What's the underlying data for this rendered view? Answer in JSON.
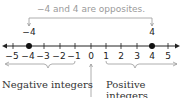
{
  "diagram": {
    "title": "−4 and 4 are opposites.",
    "number_line": {
      "min": -5,
      "max": 5,
      "ticks": [
        -5,
        -4,
        -3,
        -2,
        -1,
        0,
        1,
        2,
        3,
        4,
        5
      ],
      "tick_labels": [
        "−5",
        "−4",
        "−3",
        "−2",
        "−1",
        "0",
        "1",
        "2",
        "3",
        "4",
        "5"
      ],
      "points": [
        {
          "value": -4,
          "label": "−4"
        },
        {
          "value": 4,
          "label": "4"
        }
      ]
    },
    "labels": {
      "negative": "Negative integers",
      "positive": "Positive integers"
    },
    "colors": {
      "axis": "#222222",
      "bracket": "#999999",
      "title": "#9a9a9a"
    }
  }
}
